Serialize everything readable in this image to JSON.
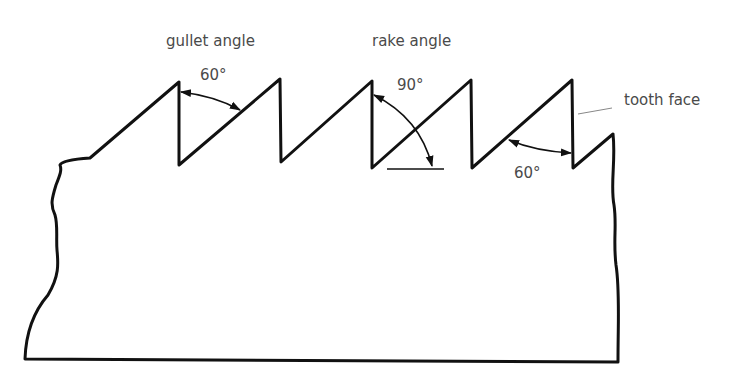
{
  "diagram": {
    "labels": {
      "gullet_angle": "gullet angle",
      "rake_angle": "rake angle",
      "tooth_face": "tooth face"
    },
    "angles": {
      "gullet": "60°",
      "rake": "90°",
      "bottom": "60°"
    },
    "colors": {
      "line": "#111111",
      "text": "#4a4a4a",
      "leader": "#888888",
      "background": "#ffffff"
    }
  }
}
